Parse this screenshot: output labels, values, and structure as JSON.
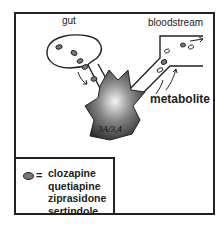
{
  "labels": {
    "gut": "gut",
    "bloodstream": "bloodstream",
    "metabolite": "metabolite",
    "enzyme": "3A/3,4"
  },
  "legend": {
    "symbol": "drug-molecule-oval",
    "equals": "=",
    "drugs": [
      "clozapine",
      "quetiapine",
      "ziprasidone",
      "sertindole"
    ]
  },
  "colors": {
    "line": "#222222",
    "molecule_fill": "#777777",
    "enzyme_dark": "#3a3a3a",
    "enzyme_light": "#f4f4f4"
  }
}
